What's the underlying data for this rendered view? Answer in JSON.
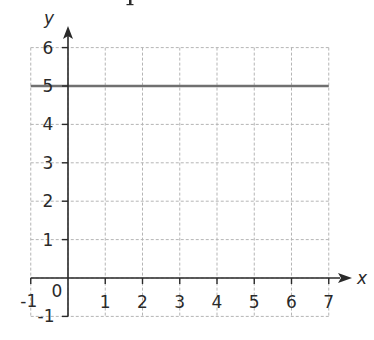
{
  "chart_data": {
    "type": "line",
    "title": "",
    "xlabel": "x",
    "ylabel": "y",
    "xlim": [
      -1,
      7
    ],
    "ylim": [
      -1,
      6
    ],
    "grid": true,
    "grid_style": "dashed",
    "x_ticks": [
      -1,
      0,
      1,
      2,
      3,
      4,
      5,
      6,
      7
    ],
    "y_ticks": [
      -1,
      0,
      1,
      2,
      3,
      4,
      5,
      6
    ],
    "x_tick_labels": [
      "-1",
      "0",
      "1",
      "2",
      "3",
      "4",
      "5",
      "6",
      "7"
    ],
    "y_tick_labels": [
      "-1",
      "1",
      "2",
      "3",
      "4",
      "5",
      "6"
    ],
    "origin_label": "0",
    "series": [
      {
        "name": "y = 5",
        "x": [
          -1,
          7
        ],
        "y": [
          5,
          5
        ],
        "color": "#707070"
      }
    ],
    "legend": null
  },
  "colors": {
    "axis": "#2a2a2a",
    "grid": "#b5b5b5",
    "line": "#707070"
  }
}
